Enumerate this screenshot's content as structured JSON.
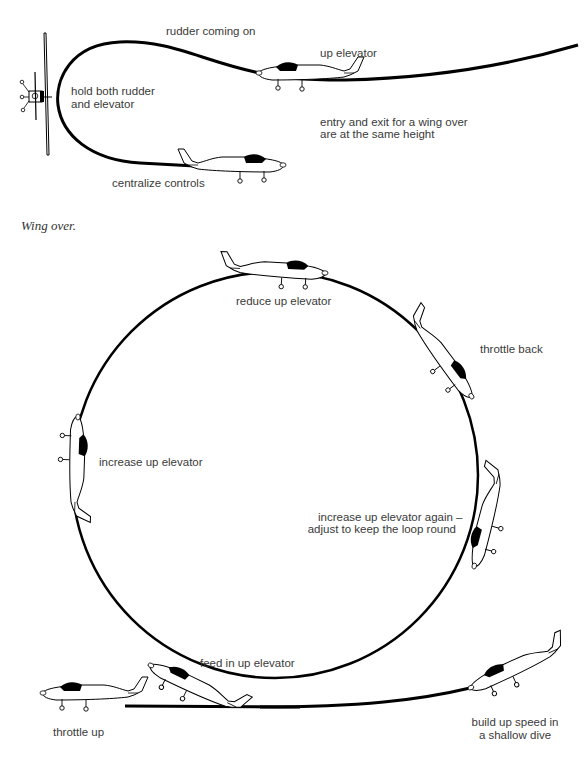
{
  "figure_top": {
    "labels": {
      "rudder_coming_on": "rudder coming on",
      "up_elevator": "up elevator",
      "hold_both_line1": "hold both rudder",
      "hold_both_line2": "and elevator",
      "entry_exit_line1": "entry and exit for a wing over",
      "entry_exit_line2": "are at the same height",
      "centralize": "centralize controls"
    }
  },
  "caption": "Wing over.",
  "figure_loop": {
    "labels": {
      "reduce_up_elevator": "reduce up elevator",
      "throttle_back": "throttle back",
      "increase_up_elevator": "increase up elevator",
      "increase_again_line1": "increase up elevator again –",
      "increase_again_line2": "adjust to keep the loop round",
      "feed_in": "feed in up elevator",
      "throttle_up": "throttle up",
      "build_up_line1": "build up speed in",
      "build_up_line2": "a shallow dive"
    }
  }
}
